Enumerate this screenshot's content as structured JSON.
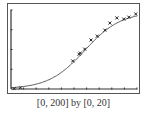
{
  "caption": "[0, 200] by [0, 20]",
  "chart_data": {
    "type": "scatter",
    "title": "",
    "xlabel": "",
    "ylabel": "",
    "xlim": [
      0,
      200
    ],
    "ylim": [
      0,
      20
    ],
    "xscale_tick": 20,
    "yscale_tick": 5,
    "grid": false,
    "series": [
      {
        "name": "data",
        "type": "scatter",
        "marker": "x",
        "x": [
          5,
          15,
          98,
          108,
          110,
          117,
          127,
          137,
          149,
          157,
          168,
          179,
          187,
          198
        ],
        "y": [
          0.1,
          0.3,
          7.1,
          8.8,
          9.1,
          10.1,
          12.4,
          13.4,
          14.9,
          16.7,
          18.0,
          17.7,
          18.2,
          19.0
        ]
      },
      {
        "name": "logistic fit",
        "type": "line",
        "formula": "y = 19.5 / (1 + 60*exp(-0.035x))"
      }
    ],
    "colors": {
      "line": "#333333",
      "axis": "#333333",
      "frame": "#555555"
    }
  }
}
